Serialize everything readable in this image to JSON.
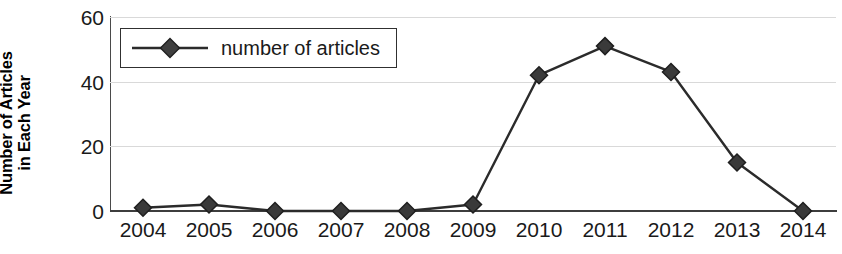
{
  "chart_data": {
    "type": "line",
    "title": "",
    "xlabel": "",
    "ylabel": "Number of Articles in Each Year",
    "ylabel_lines": [
      "Number of Articles",
      "in Each Year"
    ],
    "categories": [
      "2004",
      "2005",
      "2006",
      "2007",
      "2008",
      "2009",
      "2010",
      "2011",
      "2012",
      "2013",
      "2014"
    ],
    "series": [
      {
        "name": "number of articles",
        "values": [
          1,
          2,
          0,
          0,
          0,
          2,
          42,
          51,
          43,
          15,
          0
        ],
        "marker": "diamond",
        "marker_color": "#3a3a3a",
        "line_color": "#2b2b2b"
      }
    ],
    "ylim": [
      0,
      60
    ],
    "y_ticks": [
      0,
      20,
      40,
      60
    ],
    "y_tick_labels": [
      "0",
      "20",
      "40",
      "60"
    ],
    "grid": true,
    "grid_color": "#d9d9d9",
    "legend": {
      "position": "top-left",
      "entries": [
        "number of articles"
      ]
    },
    "axis_color": "#3d3d3d",
    "background": "#ffffff"
  },
  "legend": {
    "label": "number of articles"
  },
  "axes": {
    "y_title_line1": "Number of Articles",
    "y_title_line2": "in Each Year"
  }
}
